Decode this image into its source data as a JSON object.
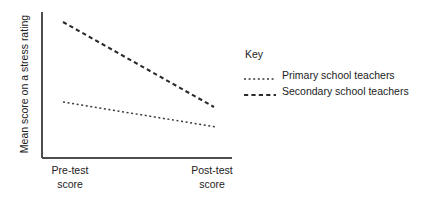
{
  "chart_data": {
    "type": "line",
    "title": "",
    "xlabel": "",
    "ylabel": "Mean score on a stress rating",
    "grid": false,
    "legend_position": "right",
    "legend_title": "Key",
    "categories": [
      "Pre-test score",
      "Post-test score"
    ],
    "category_lines": [
      {
        "l1": "Pre-test",
        "l2": "score"
      },
      {
        "l1": "Post-test",
        "l2": "score"
      }
    ],
    "y_axis_ticks": [],
    "ylim": [
      0,
      100
    ],
    "series": [
      {
        "name": "Primary school teachers",
        "style": "dotted",
        "color": "#3a3a3a",
        "values": [
          42,
          28
        ],
        "points": [
          [
            63,
            102
          ],
          [
            216,
            127
          ]
        ]
      },
      {
        "name": "Secondary school teachers",
        "style": "dashed",
        "color": "#2b2b2b",
        "values": [
          95,
          37
        ],
        "points": [
          [
            63,
            22
          ],
          [
            214,
            107
          ]
        ]
      }
    ],
    "axis": {
      "color": "#4d4d4d",
      "x_start": 42,
      "x_end": 232,
      "y_top": 12,
      "y_bottom": 158
    }
  }
}
